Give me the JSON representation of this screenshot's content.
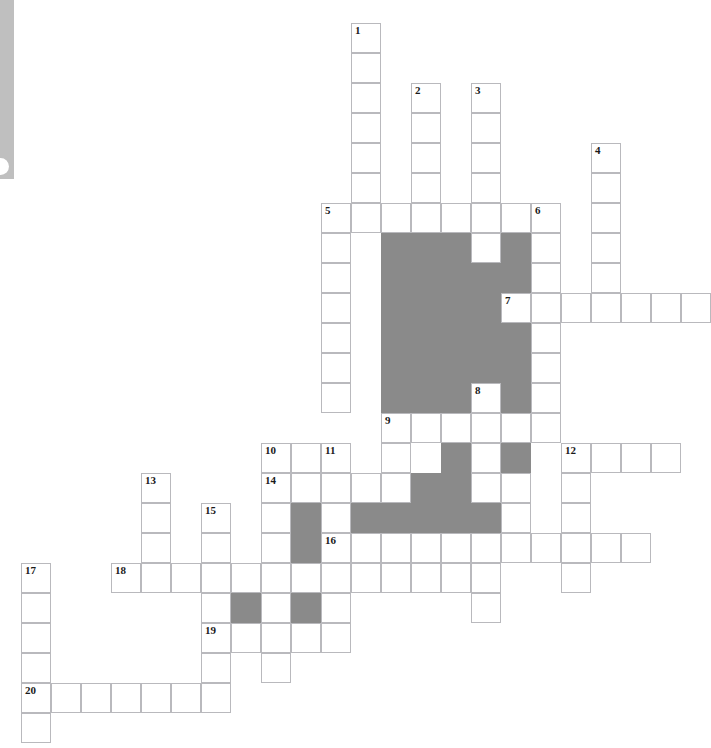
{
  "puzzle": {
    "title": "Crossword Puzzle Grid",
    "type": "crossword-grid",
    "geometry": {
      "cell_size_px": 30,
      "origin_x_px": 21,
      "origin_y_px": 23,
      "columns": 23,
      "rows": 24
    },
    "colors": {
      "cell_fill": "#ffffff",
      "cell_border": "#b9b9bd",
      "block_fill": "#8a8a8a",
      "number_text": "#1a1a1a",
      "edge_bar": "#bfbfbf",
      "page_background": "#ffffff"
    },
    "clue_numbers": [
      {
        "label": "1",
        "col": 11,
        "row": 0
      },
      {
        "label": "2",
        "col": 13,
        "row": 2
      },
      {
        "label": "3",
        "col": 15,
        "row": 2
      },
      {
        "label": "4",
        "col": 19,
        "row": 4
      },
      {
        "label": "5",
        "col": 10,
        "row": 6
      },
      {
        "label": "6",
        "col": 17,
        "row": 6
      },
      {
        "label": "7",
        "col": 16,
        "row": 9
      },
      {
        "label": "8",
        "col": 15,
        "row": 12
      },
      {
        "label": "9",
        "col": 12,
        "row": 13
      },
      {
        "label": "10",
        "col": 8,
        "row": 14
      },
      {
        "label": "11",
        "col": 10,
        "row": 14
      },
      {
        "label": "12",
        "col": 18,
        "row": 14
      },
      {
        "label": "13",
        "col": 4,
        "row": 15
      },
      {
        "label": "14",
        "col": 8,
        "row": 15
      },
      {
        "label": "15",
        "col": 6,
        "row": 16
      },
      {
        "label": "16",
        "col": 10,
        "row": 17
      },
      {
        "label": "17",
        "col": 0,
        "row": 18
      },
      {
        "label": "18",
        "col": 3,
        "row": 18
      },
      {
        "label": "19",
        "col": 6,
        "row": 20
      },
      {
        "label": "20",
        "col": 0,
        "row": 22
      }
    ],
    "open_cells": [
      {
        "col": 11,
        "row": 0
      },
      {
        "col": 11,
        "row": 1
      },
      {
        "col": 11,
        "row": 2
      },
      {
        "col": 13,
        "row": 2
      },
      {
        "col": 15,
        "row": 2
      },
      {
        "col": 11,
        "row": 3
      },
      {
        "col": 13,
        "row": 3
      },
      {
        "col": 15,
        "row": 3
      },
      {
        "col": 11,
        "row": 4
      },
      {
        "col": 13,
        "row": 4
      },
      {
        "col": 15,
        "row": 4
      },
      {
        "col": 19,
        "row": 4
      },
      {
        "col": 11,
        "row": 5
      },
      {
        "col": 13,
        "row": 5
      },
      {
        "col": 15,
        "row": 5
      },
      {
        "col": 19,
        "row": 5
      },
      {
        "col": 10,
        "row": 6
      },
      {
        "col": 11,
        "row": 6
      },
      {
        "col": 12,
        "row": 6
      },
      {
        "col": 13,
        "row": 6
      },
      {
        "col": 14,
        "row": 6
      },
      {
        "col": 15,
        "row": 6
      },
      {
        "col": 16,
        "row": 6
      },
      {
        "col": 17,
        "row": 6
      },
      {
        "col": 19,
        "row": 6
      },
      {
        "col": 10,
        "row": 7
      },
      {
        "col": 15,
        "row": 7
      },
      {
        "col": 17,
        "row": 7
      },
      {
        "col": 19,
        "row": 7
      },
      {
        "col": 10,
        "row": 8
      },
      {
        "col": 17,
        "row": 8
      },
      {
        "col": 19,
        "row": 8
      },
      {
        "col": 10,
        "row": 9
      },
      {
        "col": 16,
        "row": 9
      },
      {
        "col": 17,
        "row": 9
      },
      {
        "col": 18,
        "row": 9
      },
      {
        "col": 19,
        "row": 9
      },
      {
        "col": 20,
        "row": 9
      },
      {
        "col": 21,
        "row": 9
      },
      {
        "col": 22,
        "row": 9
      },
      {
        "col": 10,
        "row": 10
      },
      {
        "col": 17,
        "row": 10
      },
      {
        "col": 10,
        "row": 11
      },
      {
        "col": 17,
        "row": 11
      },
      {
        "col": 10,
        "row": 12
      },
      {
        "col": 15,
        "row": 12
      },
      {
        "col": 17,
        "row": 12
      },
      {
        "col": 12,
        "row": 13
      },
      {
        "col": 13,
        "row": 13
      },
      {
        "col": 14,
        "row": 13
      },
      {
        "col": 15,
        "row": 13
      },
      {
        "col": 16,
        "row": 13
      },
      {
        "col": 17,
        "row": 13
      },
      {
        "col": 8,
        "row": 14
      },
      {
        "col": 9,
        "row": 14
      },
      {
        "col": 10,
        "row": 14
      },
      {
        "col": 12,
        "row": 14
      },
      {
        "col": 15,
        "row": 14
      },
      {
        "col": 18,
        "row": 14
      },
      {
        "col": 19,
        "row": 14
      },
      {
        "col": 20,
        "row": 14
      },
      {
        "col": 21,
        "row": 14
      },
      {
        "col": 4,
        "row": 15
      },
      {
        "col": 8,
        "row": 15
      },
      {
        "col": 9,
        "row": 15
      },
      {
        "col": 10,
        "row": 15
      },
      {
        "col": 11,
        "row": 15
      },
      {
        "col": 12,
        "row": 15
      },
      {
        "col": 15,
        "row": 15
      },
      {
        "col": 16,
        "row": 15
      },
      {
        "col": 18,
        "row": 15
      },
      {
        "col": 4,
        "row": 16
      },
      {
        "col": 6,
        "row": 16
      },
      {
        "col": 8,
        "row": 16
      },
      {
        "col": 10,
        "row": 16
      },
      {
        "col": 16,
        "row": 16
      },
      {
        "col": 18,
        "row": 16
      },
      {
        "col": 4,
        "row": 17
      },
      {
        "col": 6,
        "row": 17
      },
      {
        "col": 8,
        "row": 17
      },
      {
        "col": 10,
        "row": 17
      },
      {
        "col": 11,
        "row": 17
      },
      {
        "col": 12,
        "row": 17
      },
      {
        "col": 13,
        "row": 17
      },
      {
        "col": 14,
        "row": 17
      },
      {
        "col": 15,
        "row": 17
      },
      {
        "col": 16,
        "row": 17
      },
      {
        "col": 17,
        "row": 17
      },
      {
        "col": 18,
        "row": 17
      },
      {
        "col": 19,
        "row": 17
      },
      {
        "col": 20,
        "row": 17
      },
      {
        "col": 4,
        "row": 18
      },
      {
        "col": 6,
        "row": 18
      },
      {
        "col": 8,
        "row": 18
      },
      {
        "col": 10,
        "row": 18
      },
      {
        "col": 15,
        "row": 18
      },
      {
        "col": 18,
        "row": 18
      },
      {
        "col": 0,
        "row": 18
      },
      {
        "col": 3,
        "row": 18
      },
      {
        "col": 5,
        "row": 18
      },
      {
        "col": 7,
        "row": 18
      },
      {
        "col": 9,
        "row": 18
      },
      {
        "col": 11,
        "row": 18
      },
      {
        "col": 12,
        "row": 18
      },
      {
        "col": 13,
        "row": 18
      },
      {
        "col": 14,
        "row": 18
      },
      {
        "col": 0,
        "row": 19
      },
      {
        "col": 6,
        "row": 19
      },
      {
        "col": 8,
        "row": 19
      },
      {
        "col": 10,
        "row": 19
      },
      {
        "col": 15,
        "row": 19
      },
      {
        "col": 0,
        "row": 20
      },
      {
        "col": 6,
        "row": 20
      },
      {
        "col": 7,
        "row": 20
      },
      {
        "col": 8,
        "row": 20
      },
      {
        "col": 9,
        "row": 20
      },
      {
        "col": 10,
        "row": 20
      },
      {
        "col": 0,
        "row": 21
      },
      {
        "col": 6,
        "row": 21
      },
      {
        "col": 8,
        "row": 21
      },
      {
        "col": 0,
        "row": 22
      },
      {
        "col": 1,
        "row": 22
      },
      {
        "col": 2,
        "row": 22
      },
      {
        "col": 3,
        "row": 22
      },
      {
        "col": 4,
        "row": 22
      },
      {
        "col": 5,
        "row": 22
      },
      {
        "col": 6,
        "row": 22
      },
      {
        "col": 0,
        "row": 23
      }
    ],
    "block_cells": [
      {
        "col": 12,
        "row": 7
      },
      {
        "col": 13,
        "row": 7
      },
      {
        "col": 14,
        "row": 7
      },
      {
        "col": 16,
        "row": 7
      },
      {
        "col": 12,
        "row": 8
      },
      {
        "col": 13,
        "row": 8
      },
      {
        "col": 14,
        "row": 8
      },
      {
        "col": 15,
        "row": 8
      },
      {
        "col": 16,
        "row": 8
      },
      {
        "col": 12,
        "row": 9
      },
      {
        "col": 13,
        "row": 9
      },
      {
        "col": 14,
        "row": 9
      },
      {
        "col": 15,
        "row": 9
      },
      {
        "col": 12,
        "row": 10
      },
      {
        "col": 13,
        "row": 10
      },
      {
        "col": 14,
        "row": 10
      },
      {
        "col": 15,
        "row": 10
      },
      {
        "col": 16,
        "row": 10
      },
      {
        "col": 12,
        "row": 11
      },
      {
        "col": 13,
        "row": 11
      },
      {
        "col": 14,
        "row": 11
      },
      {
        "col": 15,
        "row": 11
      },
      {
        "col": 16,
        "row": 11
      },
      {
        "col": 12,
        "row": 12
      },
      {
        "col": 13,
        "row": 12
      },
      {
        "col": 14,
        "row": 12
      },
      {
        "col": 16,
        "row": 12
      },
      {
        "col": 14,
        "row": 14
      },
      {
        "col": 16,
        "row": 14
      },
      {
        "col": 13,
        "row": 15
      },
      {
        "col": 14,
        "row": 15
      },
      {
        "col": 9,
        "row": 16
      },
      {
        "col": 11,
        "row": 16
      },
      {
        "col": 12,
        "row": 16
      },
      {
        "col": 13,
        "row": 16
      },
      {
        "col": 14,
        "row": 16
      },
      {
        "col": 15,
        "row": 16
      },
      {
        "col": 9,
        "row": 17
      },
      {
        "col": 9,
        "row": 18
      },
      {
        "col": 7,
        "row": 19
      },
      {
        "col": 9,
        "row": 19
      }
    ]
  }
}
